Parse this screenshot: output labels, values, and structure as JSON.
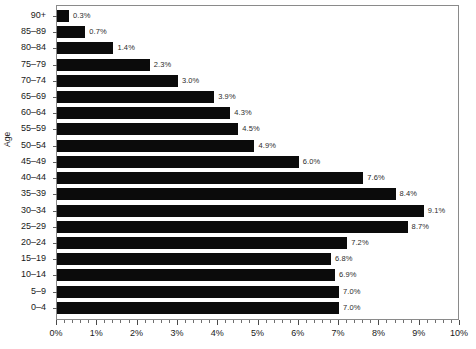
{
  "chart_data": {
    "type": "bar",
    "orientation": "horizontal",
    "title": "",
    "xlabel": "",
    "ylabel": "Age",
    "xlim": [
      0,
      10
    ],
    "ylim": null,
    "grid": false,
    "legend": null,
    "x_tick_labels": [
      "0%",
      "1%",
      "2%",
      "3%",
      "4%",
      "5%",
      "6%",
      "7%",
      "8%",
      "9%",
      "10%"
    ],
    "x_tick_values": [
      0,
      1,
      2,
      3,
      4,
      5,
      6,
      7,
      8,
      9,
      10
    ],
    "x_minor_ticks_per_major": 5,
    "categories": [
      "90+",
      "85–89",
      "80–84",
      "75–79",
      "70–74",
      "65–69",
      "60–64",
      "55–59",
      "50–54",
      "45–49",
      "40–44",
      "35–39",
      "30–34",
      "25–29",
      "20–24",
      "15–19",
      "10–14",
      "5–9",
      "0–4"
    ],
    "values": [
      0.3,
      0.7,
      1.4,
      2.3,
      3.0,
      3.9,
      4.3,
      4.5,
      4.9,
      6.0,
      7.6,
      8.4,
      9.1,
      8.7,
      7.2,
      6.8,
      6.9,
      7.0,
      7.0
    ],
    "data_labels": [
      "0.3%",
      "0.7%",
      "1.4%",
      "2.3%",
      "3.0%",
      "3.9%",
      "4.3%",
      "4.5%",
      "4.9%",
      "6.0%",
      "7.6%",
      "8.4%",
      "9.1%",
      "8.7%",
      "7.2%",
      "6.8%",
      "6.9%",
      "7.0%",
      "7.0%"
    ],
    "bar_color": "#0b0b0b",
    "axis_color": "#8a8a8a",
    "text_color": "#1a1a1a",
    "background_color": "#ffffff"
  }
}
